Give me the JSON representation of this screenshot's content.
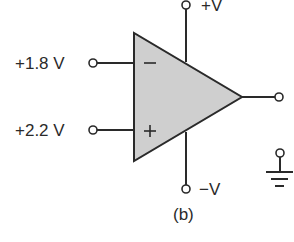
{
  "diagram": {
    "type": "op-amp comparator",
    "caption": "(b)",
    "supply": {
      "positive_label": "+V",
      "negative_label": "−V"
    },
    "inputs": {
      "inverting": {
        "symbol": "−",
        "voltage_label": "+1.8 V"
      },
      "non_inverting": {
        "symbol": "+",
        "voltage_label": "+2.2 V"
      }
    },
    "output": {
      "terminal": "output-terminal"
    },
    "ground": {
      "symbol": "ground"
    },
    "colors": {
      "triangle_fill": "#cfcfcf",
      "stroke": "#2a2a2a",
      "background": "#ffffff"
    }
  }
}
